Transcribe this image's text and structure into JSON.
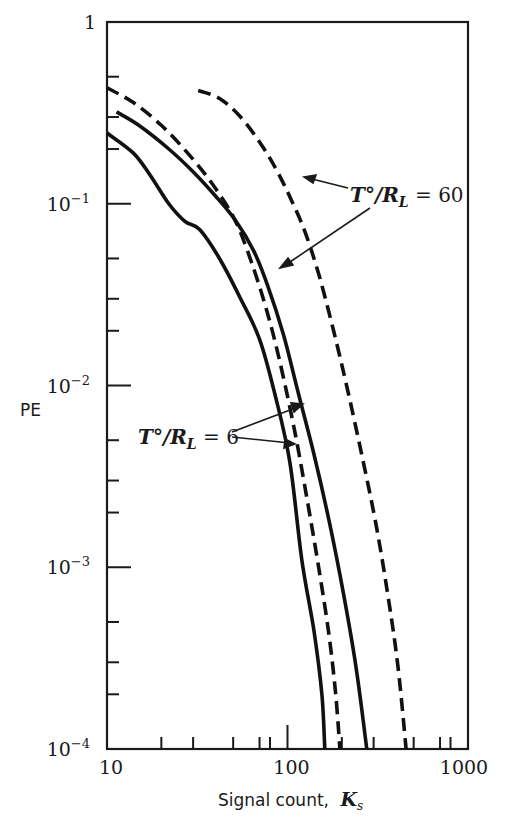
{
  "chart_data": {
    "type": "line",
    "title": "",
    "xlabel": "Signal count, K_s",
    "xlabel_text": "Signal count,",
    "xlabel_symbol": "K",
    "xlabel_subscript": "s",
    "ylabel": "PE",
    "xscale": "log",
    "yscale": "log",
    "xlim": [
      10,
      1000
    ],
    "ylim": [
      0.0001,
      1
    ],
    "grid": false,
    "legend": null,
    "x_ticks": [
      {
        "value": 10,
        "label": "10"
      },
      {
        "value": 100,
        "label": "100"
      },
      {
        "value": 1000,
        "label": "1000"
      }
    ],
    "x_minor_ticks": [
      20,
      30,
      50,
      70,
      80,
      200,
      300,
      500,
      700,
      800
    ],
    "y_ticks": [
      {
        "value": 1,
        "base": "1",
        "exp": ""
      },
      {
        "value": 0.1,
        "base": "10",
        "exp": "-1"
      },
      {
        "value": 0.01,
        "base": "10",
        "exp": "-2"
      },
      {
        "value": 0.001,
        "base": "10",
        "exp": "-3"
      },
      {
        "value": 0.0001,
        "base": "10",
        "exp": "-4"
      }
    ],
    "y_minor_multipliers": [
      2,
      3,
      5
    ],
    "series": [
      {
        "name": "T°/R_L = 6 (solid)",
        "style": "solid",
        "points": [
          [
            10,
            0.245
          ],
          [
            14,
            0.19
          ],
          [
            17.3,
            0.144
          ],
          [
            22,
            0.1
          ],
          [
            27,
            0.08
          ],
          [
            32.7,
            0.072
          ],
          [
            42,
            0.05
          ],
          [
            55,
            0.03
          ],
          [
            70,
            0.018
          ],
          [
            85,
            0.009
          ],
          [
            103,
            0.0038
          ],
          [
            120,
            0.0011
          ],
          [
            140,
            0.00045
          ],
          [
            155,
            0.0002
          ],
          [
            161,
            0.0001
          ]
        ]
      },
      {
        "name": "T°/R_L = 6 (dashed)",
        "style": "dashed",
        "points": [
          [
            10,
            0.435
          ],
          [
            14,
            0.36
          ],
          [
            20,
            0.27
          ],
          [
            28,
            0.19
          ],
          [
            38,
            0.13
          ],
          [
            50,
            0.085
          ],
          [
            60,
            0.055
          ],
          [
            75,
            0.028
          ],
          [
            90,
            0.014
          ],
          [
            110,
            0.0055
          ],
          [
            130,
            0.0022
          ],
          [
            150,
            0.00095
          ],
          [
            170,
            0.00042
          ],
          [
            185,
            0.0002
          ],
          [
            195,
            0.0001
          ]
        ]
      },
      {
        "name": "T°/R_L = 60 (solid)",
        "style": "solid",
        "points": [
          [
            11.3,
            0.32
          ],
          [
            15,
            0.27
          ],
          [
            22,
            0.2
          ],
          [
            30,
            0.15
          ],
          [
            40,
            0.11
          ],
          [
            52,
            0.08
          ],
          [
            65,
            0.055
          ],
          [
            78,
            0.035
          ],
          [
            95,
            0.019
          ],
          [
            115,
            0.009
          ],
          [
            140,
            0.0042
          ],
          [
            170,
            0.0018
          ],
          [
            205,
            0.0007
          ],
          [
            240,
            0.00028
          ],
          [
            275,
            0.0001
          ]
        ]
      },
      {
        "name": "T°/R_L = 60 (dashed)",
        "style": "dashed",
        "points": [
          [
            32,
            0.42
          ],
          [
            42,
            0.38
          ],
          [
            55,
            0.3
          ],
          [
            72,
            0.21
          ],
          [
            88,
            0.15
          ],
          [
            105,
            0.105
          ],
          [
            125,
            0.07
          ],
          [
            150,
            0.04
          ],
          [
            180,
            0.02
          ],
          [
            215,
            0.0095
          ],
          [
            260,
            0.004
          ],
          [
            310,
            0.0017
          ],
          [
            360,
            0.0007
          ],
          [
            410,
            0.00028
          ],
          [
            454,
            0.0001
          ]
        ]
      }
    ],
    "annotations": [
      {
        "text_main": "T°/R",
        "text_sub": "L",
        "text_rest": " = 60",
        "x": 350,
        "y": 202
      },
      {
        "text_main": "T°/R",
        "text_sub": "L",
        "text_rest": " = 6",
        "x": 138,
        "y": 444
      }
    ]
  }
}
